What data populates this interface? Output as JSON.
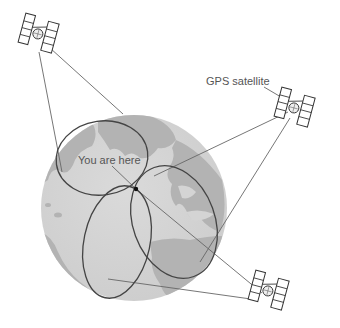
{
  "diagram": {
    "type": "illustration",
    "labels": {
      "you_are_here": "You are here",
      "gps_satellite": "GPS satellite"
    },
    "colors": {
      "background": "#ffffff",
      "ocean": "#d4d4d4",
      "land": "#b3b3b3",
      "range_circle": "#444444",
      "signal_line": "#666666",
      "satellite_stroke": "#333333",
      "label_text": "#555555"
    },
    "satellites": [
      {
        "id": "satellite-top-left",
        "icon": "satellite-icon"
      },
      {
        "id": "satellite-right",
        "icon": "satellite-icon"
      },
      {
        "id": "satellite-bottom-right",
        "icon": "satellite-icon"
      }
    ],
    "range_circles_count": 3
  }
}
